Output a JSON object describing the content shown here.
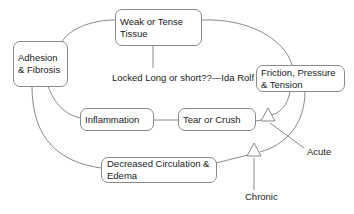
{
  "diagram": {
    "type": "cycle-diagram",
    "nodes": {
      "weak_tissue": "Weak or Tense Tissue",
      "adhesion": "Adhesion & Fibrosis",
      "friction": "Friction, Pressure & Tension",
      "inflammation": "Inflammation",
      "tear": "Tear or Crush",
      "circulation": "Decreased Circulation & Edema"
    },
    "annotations": {
      "quote": "Locked Long or short??—Ida Rolf",
      "acute": "Acute",
      "chronic": "Chronic"
    },
    "colors": {
      "line": "#8a8a8a",
      "box_border": "#8a8a8a",
      "text": "#222222"
    }
  }
}
